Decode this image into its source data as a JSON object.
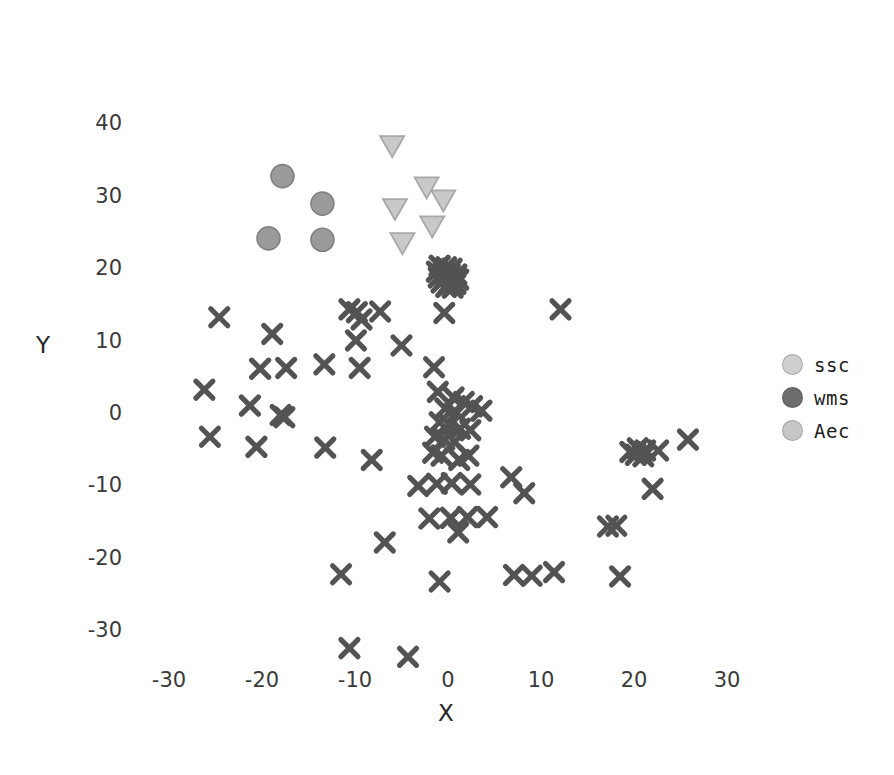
{
  "chart_data": {
    "type": "scatter",
    "title": "",
    "xlabel": "X",
    "ylabel": "Y",
    "xlim": [
      -36,
      34
    ],
    "ylim": [
      -37,
      42
    ],
    "xticks": [
      -30,
      -20,
      -10,
      0,
      10,
      20,
      30
    ],
    "yticks": [
      -30,
      -20,
      -10,
      0,
      10,
      20,
      30,
      40
    ],
    "grid": false,
    "legend_position": "right",
    "series": [
      {
        "name": "ssc",
        "marker": "triangle-down",
        "color": "#c9c9c9",
        "edge_color": "#a8a8a8",
        "points": [
          [
            -6.0,
            37.2
          ],
          [
            -2.3,
            31.5
          ],
          [
            -0.5,
            29.7
          ],
          [
            -5.7,
            28.5
          ],
          [
            -1.7,
            26.1
          ],
          [
            -4.9,
            23.8
          ]
        ]
      },
      {
        "name": "wms",
        "marker": "x",
        "color": "#535353",
        "edge_color": "#535353",
        "points": [
          [
            -0.9,
            20.6
          ],
          [
            -0.2,
            20.4
          ],
          [
            0.4,
            20.2
          ],
          [
            -1.2,
            19.8
          ],
          [
            -0.5,
            19.6
          ],
          [
            0.2,
            19.5
          ],
          [
            0.9,
            19.4
          ],
          [
            -1.0,
            19.0
          ],
          [
            -0.3,
            18.9
          ],
          [
            0.4,
            18.8
          ],
          [
            1.1,
            18.7
          ],
          [
            -0.7,
            18.3
          ],
          [
            0.1,
            18.2
          ],
          [
            0.8,
            18.1
          ],
          [
            -0.2,
            17.7
          ],
          [
            0.5,
            17.6
          ],
          [
            -0.4,
            14.1
          ],
          [
            -10.6,
            14.6
          ],
          [
            -9.8,
            14.2
          ],
          [
            -9.3,
            13.2
          ],
          [
            -7.3,
            14.3
          ],
          [
            12.1,
            14.6
          ],
          [
            -24.6,
            13.5
          ],
          [
            -18.9,
            11.2
          ],
          [
            -9.9,
            10.3
          ],
          [
            -5.0,
            9.6
          ],
          [
            -20.2,
            6.4
          ],
          [
            -17.4,
            6.5
          ],
          [
            -13.3,
            7.0
          ],
          [
            -9.5,
            6.5
          ],
          [
            -1.5,
            6.6
          ],
          [
            -26.2,
            3.5
          ],
          [
            -1.1,
            3.2
          ],
          [
            0.6,
            2.4
          ],
          [
            1.7,
            1.8
          ],
          [
            2.6,
            1.2
          ],
          [
            3.6,
            0.6
          ],
          [
            -0.3,
            0.9
          ],
          [
            0.9,
            0.3
          ],
          [
            -21.3,
            1.3
          ],
          [
            -25.6,
            -3.0
          ],
          [
            -18.0,
            0.0
          ],
          [
            -17.6,
            -0.3
          ],
          [
            -20.6,
            -4.4
          ],
          [
            -0.9,
            -1.0
          ],
          [
            0.2,
            -1.4
          ],
          [
            1.3,
            -1.9
          ],
          [
            2.4,
            -2.1
          ],
          [
            -1.4,
            -3.0
          ],
          [
            -0.4,
            -3.4
          ],
          [
            0.7,
            -3.7
          ],
          [
            -13.2,
            -4.5
          ],
          [
            -1.6,
            -5.2
          ],
          [
            -0.7,
            -5.6
          ],
          [
            -8.2,
            -6.2
          ],
          [
            1.2,
            -6.2
          ],
          [
            2.2,
            -5.6
          ],
          [
            20.4,
            -4.6
          ],
          [
            21.2,
            -4.9
          ],
          [
            19.6,
            -5.1
          ],
          [
            20.2,
            -5.5
          ],
          [
            21.0,
            -5.7
          ],
          [
            22.6,
            -4.9
          ],
          [
            25.8,
            -3.4
          ],
          [
            -3.2,
            -9.8
          ],
          [
            -1.2,
            -9.5
          ],
          [
            0.4,
            -9.4
          ],
          [
            2.4,
            -9.6
          ],
          [
            6.8,
            -8.6
          ],
          [
            8.2,
            -10.8
          ],
          [
            22.0,
            -10.2
          ],
          [
            -2.0,
            -14.3
          ],
          [
            0.3,
            -14.2
          ],
          [
            2.1,
            -14.1
          ],
          [
            4.2,
            -14.1
          ],
          [
            1.1,
            -16.2
          ],
          [
            17.2,
            -15.4
          ],
          [
            18.1,
            -15.3
          ],
          [
            -11.5,
            -22.0
          ],
          [
            -6.8,
            -17.6
          ],
          [
            -0.9,
            -23.0
          ],
          [
            7.1,
            -22.1
          ],
          [
            9.0,
            -22.2
          ],
          [
            11.4,
            -21.7
          ],
          [
            18.5,
            -22.3
          ],
          [
            -10.6,
            -32.2
          ],
          [
            -4.3,
            -33.4
          ]
        ]
      },
      {
        "name": "Aec",
        "marker": "circle",
        "color": "#9a9a9a",
        "edge_color": "#808080",
        "points": [
          [
            -17.8,
            33.0
          ],
          [
            -13.5,
            29.2
          ],
          [
            -19.3,
            24.4
          ],
          [
            -13.5,
            24.2
          ]
        ]
      }
    ]
  },
  "legend": {
    "items": [
      {
        "label": "ssc",
        "color": "#cfcfcf"
      },
      {
        "label": "wms",
        "color": "#6d6d6d"
      },
      {
        "label": "Aec",
        "color": "#c6c6c6"
      }
    ]
  }
}
